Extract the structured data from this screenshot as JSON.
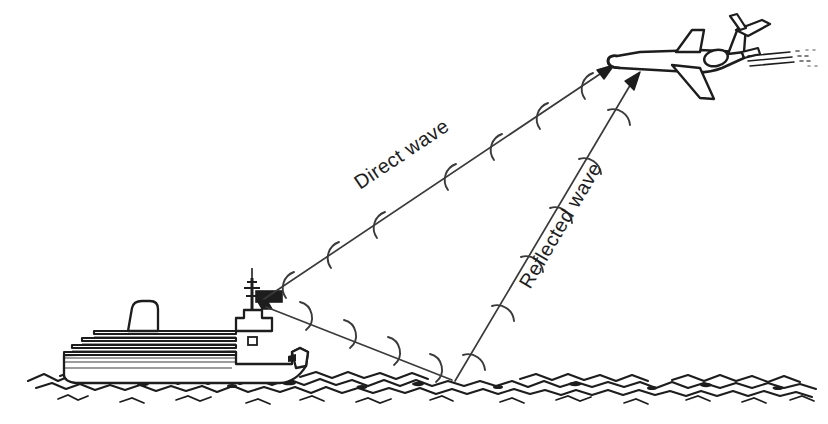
{
  "figure": {
    "background_color": "#ffffff",
    "ink_color": "#1d1d1d",
    "line_color": "#3a3a3a"
  },
  "labels": {
    "direct_wave": "Direct wave",
    "reflected_wave": "Reflected wave"
  },
  "objects": {
    "ship": {
      "name": "aircraft-carrier",
      "antenna": "radar-antenna",
      "funnel": "funnel",
      "mast": "mast",
      "hull": "hull",
      "deck_tiers": "deck-tiers"
    },
    "aircraft": {
      "name": "jet-airliner",
      "exhaust": "engine-exhaust-trails",
      "tail": "t-tail",
      "wing": "wing"
    },
    "sea": {
      "name": "sea-surface",
      "reflection_point": "specular-reflection-point"
    }
  },
  "paths": {
    "direct": {
      "name": "direct-wave-ray",
      "from": "ship-antenna",
      "to": "aircraft",
      "start": [
        258,
        300
      ],
      "end": [
        614,
        66
      ],
      "wavefront_count": 7
    },
    "reflected_down": {
      "name": "reflected-wave-downleg",
      "from": "ship-antenna",
      "to": "sea-reflection-point",
      "start": [
        258,
        308
      ],
      "end": [
        455,
        382
      ],
      "wavefront_count": 4
    },
    "reflected_up": {
      "name": "reflected-wave-upleg",
      "from": "sea-reflection-point",
      "to": "aircraft",
      "start": [
        455,
        382
      ],
      "end": [
        640,
        76
      ],
      "wavefront_count": 6
    }
  }
}
